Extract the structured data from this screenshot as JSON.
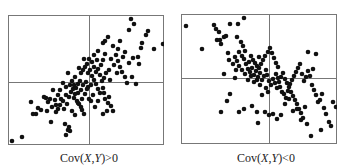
{
  "chart_data": [
    {
      "type": "scatter",
      "title": "",
      "caption": "Cov(X,Y)>0",
      "caption_parts": {
        "pre": "Cov(",
        "x": "X",
        "sep": ",",
        "y": "Y",
        "post": ")>0"
      },
      "xlabel": "",
      "ylabel": "",
      "grid": false,
      "axes_ticks": false,
      "quadrant_lines": {
        "x_frac": 0.52,
        "y_frac": 0.515
      },
      "box": {
        "left": 8,
        "top": 15,
        "width": 156,
        "height": 130
      },
      "divider": {
        "x": 81,
        "y": 67
      },
      "point_color": "#111111",
      "frame_color": "#777777",
      "point_radius": 2.3,
      "trend": "positive correlation",
      "points": [
        [
          4,
          126
        ],
        [
          14,
          122
        ],
        [
          28,
          99
        ],
        [
          25,
          99
        ],
        [
          43,
          107
        ],
        [
          57,
          109
        ],
        [
          60,
          115
        ],
        [
          61,
          112
        ],
        [
          62,
          116
        ],
        [
          58,
          120
        ],
        [
          23,
          87
        ],
        [
          38,
          83
        ],
        [
          45,
          75
        ],
        [
          40,
          87
        ],
        [
          42,
          84
        ],
        [
          48,
          90
        ],
        [
          50,
          94
        ],
        [
          52,
          90
        ],
        [
          55,
          86
        ],
        [
          58,
          80
        ],
        [
          61,
          82
        ],
        [
          63,
          77
        ],
        [
          65,
          74
        ],
        [
          67,
          79
        ],
        [
          69,
          86
        ],
        [
          71,
          89
        ],
        [
          73,
          92
        ],
        [
          74,
          84
        ],
        [
          77,
          79
        ],
        [
          79,
          74
        ],
        [
          55,
          68
        ],
        [
          52,
          75
        ],
        [
          58,
          72
        ],
        [
          62,
          70
        ],
        [
          64,
          66
        ],
        [
          66,
          70
        ],
        [
          68,
          73
        ],
        [
          70,
          69
        ],
        [
          72,
          66
        ],
        [
          75,
          70
        ],
        [
          78,
          67
        ],
        [
          80,
          72
        ],
        [
          83,
          70
        ],
        [
          86,
          65
        ],
        [
          88,
          69
        ],
        [
          90,
          74
        ],
        [
          92,
          78
        ],
        [
          95,
          73
        ],
        [
          96,
          78
        ],
        [
          97,
          84
        ],
        [
          100,
          88
        ],
        [
          101,
          82
        ],
        [
          103,
          91
        ],
        [
          105,
          96
        ],
        [
          99,
          96
        ],
        [
          90,
          86
        ],
        [
          85,
          80
        ],
        [
          83,
          86
        ],
        [
          87,
          92
        ],
        [
          81,
          84
        ],
        [
          71,
          53
        ],
        [
          73,
          58
        ],
        [
          75,
          55
        ],
        [
          77,
          52
        ],
        [
          79,
          49
        ],
        [
          80,
          58
        ],
        [
          82,
          55
        ],
        [
          84,
          61
        ],
        [
          86,
          52
        ],
        [
          88,
          57
        ],
        [
          90,
          54
        ],
        [
          92,
          60
        ],
        [
          94,
          66
        ],
        [
          96,
          63
        ],
        [
          98,
          58
        ],
        [
          89,
          45
        ],
        [
          86,
          40
        ],
        [
          84,
          47
        ],
        [
          81,
          44
        ],
        [
          76,
          44
        ],
        [
          90,
          36
        ],
        [
          95,
          28
        ],
        [
          97,
          26
        ],
        [
          100,
          22
        ],
        [
          105,
          31
        ],
        [
          108,
          40
        ],
        [
          110,
          46
        ],
        [
          112,
          52
        ],
        [
          114,
          57
        ],
        [
          117,
          62
        ],
        [
          119,
          68
        ],
        [
          124,
          62
        ],
        [
          128,
          69
        ],
        [
          130,
          42
        ],
        [
          133,
          33
        ],
        [
          134,
          28
        ],
        [
          138,
          20
        ],
        [
          140,
          16
        ],
        [
          146,
          34
        ],
        [
          155,
          29
        ],
        [
          121,
          15
        ],
        [
          126,
          9
        ],
        [
          123,
          4
        ],
        [
          115,
          42
        ],
        [
          121,
          48
        ],
        [
          112,
          26
        ],
        [
          93,
          50
        ],
        [
          95,
          45
        ],
        [
          67,
          62
        ],
        [
          60,
          58
        ],
        [
          97,
          39
        ],
        [
          103,
          44
        ],
        [
          106,
          50
        ],
        [
          101,
          55
        ],
        [
          110,
          34
        ],
        [
          117,
          37
        ],
        [
          125,
          43
        ],
        [
          131,
          49
        ],
        [
          109,
          58
        ],
        [
          102,
          65
        ],
        [
          30,
          93
        ],
        [
          33,
          95
        ],
        [
          36,
          82
        ],
        [
          48,
          97
        ],
        [
          64,
          96
        ],
        [
          67,
          100
        ],
        [
          70,
          88
        ],
        [
          74,
          95
        ],
        [
          76,
          99
        ],
        [
          95,
          99
        ],
        [
          70,
          78
        ],
        [
          73,
          75
        ],
        [
          66,
          83
        ],
        [
          59,
          89
        ],
        [
          56,
          94
        ],
        [
          53,
          84
        ],
        [
          50,
          80
        ],
        [
          47,
          85
        ],
        [
          44,
          92
        ],
        [
          39,
          96
        ]
      ]
    },
    {
      "type": "scatter",
      "title": "",
      "caption": "Cov(X,Y)<0",
      "caption_parts": {
        "pre": "Cov(",
        "x": "X",
        "sep": ",",
        "y": "Y",
        "post": ")<0"
      },
      "xlabel": "",
      "ylabel": "",
      "grid": false,
      "axes_ticks": false,
      "quadrant_lines": {
        "x_frac": 0.565,
        "y_frac": 0.49
      },
      "box": {
        "left": 181,
        "top": 14,
        "width": 156,
        "height": 130
      },
      "divider": {
        "x": 88,
        "y": 64
      },
      "point_color": "#111111",
      "frame_color": "#777777",
      "point_radius": 2.3,
      "trend": "negative correlation",
      "points": [
        [
          5,
          12
        ],
        [
          21,
          35
        ],
        [
          33,
          11
        ],
        [
          35,
          15
        ],
        [
          38,
          18
        ],
        [
          36,
          26
        ],
        [
          39,
          26
        ],
        [
          43,
          23
        ],
        [
          45,
          22
        ],
        [
          40,
          30
        ],
        [
          49,
          10
        ],
        [
          57,
          10
        ],
        [
          63,
          4
        ],
        [
          56,
          23
        ],
        [
          60,
          28
        ],
        [
          62,
          32
        ],
        [
          64,
          37
        ],
        [
          47,
          39
        ],
        [
          54,
          43
        ],
        [
          56,
          47
        ],
        [
          58,
          38
        ],
        [
          61,
          42
        ],
        [
          63,
          45
        ],
        [
          65,
          50
        ],
        [
          68,
          48
        ],
        [
          70,
          42
        ],
        [
          72,
          46
        ],
        [
          74,
          49
        ],
        [
          76,
          52
        ],
        [
          78,
          43
        ],
        [
          67,
          55
        ],
        [
          69,
          58
        ],
        [
          71,
          54
        ],
        [
          73,
          61
        ],
        [
          75,
          57
        ],
        [
          77,
          63
        ],
        [
          79,
          59
        ],
        [
          81,
          66
        ],
        [
          83,
          62
        ],
        [
          85,
          56
        ],
        [
          43,
          60
        ],
        [
          54,
          64
        ],
        [
          49,
          80
        ],
        [
          46,
          87
        ],
        [
          40,
          98
        ],
        [
          58,
          98
        ],
        [
          63,
          95
        ],
        [
          71,
          92
        ],
        [
          76,
          98
        ],
        [
          77,
          109
        ],
        [
          78,
          54
        ],
        [
          80,
          50
        ],
        [
          82,
          46
        ],
        [
          84,
          42
        ],
        [
          87,
          38
        ],
        [
          89,
          34
        ],
        [
          91,
          39
        ],
        [
          93,
          44
        ],
        [
          95,
          49
        ],
        [
          97,
          53
        ],
        [
          86,
          61
        ],
        [
          88,
          67
        ],
        [
          90,
          71
        ],
        [
          92,
          65
        ],
        [
          94,
          69
        ],
        [
          96,
          74
        ],
        [
          98,
          68
        ],
        [
          100,
          63
        ],
        [
          102,
          59
        ],
        [
          104,
          65
        ],
        [
          106,
          69
        ],
        [
          108,
          73
        ],
        [
          110,
          78
        ],
        [
          112,
          82
        ],
        [
          114,
          86
        ],
        [
          116,
          90
        ],
        [
          118,
          95
        ],
        [
          120,
          99
        ],
        [
          122,
          104
        ],
        [
          124,
          93
        ],
        [
          99,
          73
        ],
        [
          101,
          78
        ],
        [
          103,
          80
        ],
        [
          105,
          84
        ],
        [
          107,
          77
        ],
        [
          109,
          70
        ],
        [
          111,
          66
        ],
        [
          113,
          62
        ],
        [
          115,
          58
        ],
        [
          117,
          54
        ],
        [
          119,
          50
        ],
        [
          121,
          60
        ],
        [
          123,
          67
        ],
        [
          125,
          63
        ],
        [
          127,
          57
        ],
        [
          129,
          62
        ],
        [
          131,
          71
        ],
        [
          133,
          76
        ],
        [
          135,
          81
        ],
        [
          137,
          88
        ],
        [
          139,
          86
        ],
        [
          141,
          80
        ],
        [
          143,
          94
        ],
        [
          145,
          100
        ],
        [
          148,
          108
        ],
        [
          152,
          88
        ],
        [
          155,
          93
        ],
        [
          127,
          38
        ],
        [
          135,
          40
        ],
        [
          132,
          55
        ],
        [
          84,
          98
        ],
        [
          88,
          101
        ],
        [
          92,
          100
        ],
        [
          96,
          105
        ],
        [
          100,
          101
        ],
        [
          104,
          90
        ],
        [
          108,
          85
        ],
        [
          112,
          97
        ],
        [
          116,
          95
        ],
        [
          120,
          106
        ],
        [
          126,
          110
        ],
        [
          130,
          122
        ],
        [
          140,
          116
        ],
        [
          150,
          112
        ],
        [
          95,
          60
        ],
        [
          97,
          64
        ],
        [
          85,
          74
        ],
        [
          87,
          78
        ],
        [
          81,
          81
        ],
        [
          79,
          71
        ],
        [
          76,
          66
        ],
        [
          73,
          68
        ],
        [
          70,
          62
        ],
        [
          67,
          66
        ],
        [
          64,
          60
        ],
        [
          61,
          56
        ],
        [
          58,
          52
        ],
        [
          55,
          56
        ],
        [
          52,
          50
        ],
        [
          48,
          46
        ]
      ]
    }
  ]
}
